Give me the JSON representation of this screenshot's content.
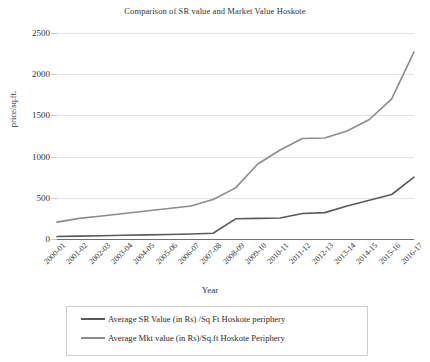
{
  "chart_data": {
    "type": "line",
    "title": "Comparison of SR value and Market Value Hoskote",
    "xlabel": "Year",
    "ylabel": "price/sq.ft.",
    "ylim": [
      0,
      2500
    ],
    "yticks": [
      0,
      500,
      1000,
      1500,
      2000,
      2500
    ],
    "grid": true,
    "legend_position": "bottom",
    "categories": [
      "2000-01",
      "2001-02",
      "2002-03",
      "2003-04",
      "2004-05",
      "2005-06",
      "2006-07",
      "2007-08",
      "2008-09",
      "2009-10",
      "2010-11",
      "2011-12",
      "2012-13",
      "2013-14",
      "2014-15",
      "2015-16",
      "2016-17"
    ],
    "series": [
      {
        "name": "Average SR Value (in Rs) /Sq Ft Hoskote periphery",
        "color": "#5a5a5a",
        "values": [
          30,
          35,
          40,
          45,
          50,
          55,
          60,
          70,
          245,
          250,
          255,
          310,
          320,
          400,
          470,
          540,
          750
        ]
      },
      {
        "name": "Average Mkt value (in Rs)/Sq.ft Hoskote Periphery",
        "color": "#8c8c8c",
        "values": [
          205,
          250,
          280,
          310,
          340,
          370,
          400,
          480,
          620,
          910,
          1080,
          1220,
          1225,
          1310,
          1450,
          1700,
          2270
        ]
      }
    ]
  },
  "legend": {
    "items": [
      {
        "label": "Average SR Value (in Rs) /Sq Ft Hoskote periphery"
      },
      {
        "label": "Average Mkt value (in Rs)/Sq.ft Hoskote Periphery"
      }
    ]
  },
  "colors": {
    "series_sr": "#5a5a5a",
    "series_mkt": "#8c8c8c",
    "gridline": "#e3e3e3",
    "axis": "#6e6e6e",
    "text": "#2b2b2b",
    "background": "#ffffff"
  }
}
